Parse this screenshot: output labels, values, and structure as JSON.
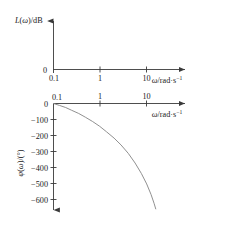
{
  "figure": {
    "title": "",
    "background": "#ffffff",
    "axis_color": "#3a3a3a",
    "curve_color": "#7a7a7a"
  },
  "chart_data": [
    {
      "type": "line",
      "name": "magnitude-plot",
      "title": "",
      "xlabel": "ω/rad·s⁻¹",
      "ylabel": "L(ω)/dB",
      "xscale": "log",
      "x_ticks": [
        0.1,
        1,
        10
      ],
      "x_tick_labels": [
        "0.1",
        "1",
        "10"
      ],
      "xlim": [
        0.1,
        60
      ],
      "y_ticks": [
        0
      ],
      "y_tick_labels": [
        "0"
      ],
      "ylim": [
        0,
        1
      ],
      "grid": false,
      "legend": "none",
      "series": [
        {
          "name": "L(ω)",
          "x": [],
          "values": []
        }
      ],
      "annotations": []
    },
    {
      "type": "line",
      "name": "phase-plot",
      "title": "",
      "xlabel": "ω/rad·s⁻¹",
      "ylabel": "φ(ω)/(°)",
      "xscale": "log",
      "x_ticks": [
        0.1,
        1,
        10
      ],
      "x_tick_labels": [
        "0.1",
        "1",
        "10"
      ],
      "xlim": [
        0.1,
        60
      ],
      "y_ticks": [
        0,
        -100,
        -200,
        -300,
        -400,
        -500,
        -600
      ],
      "y_tick_labels": [
        "0",
        "−100",
        "−200",
        "−300",
        "−400",
        "−500",
        "−600"
      ],
      "ylim": [
        -680,
        0
      ],
      "grid": false,
      "legend": "none",
      "series": [
        {
          "name": "φ(ω)",
          "x": [
            0.1,
            0.13,
            0.17,
            0.22,
            0.3,
            0.4,
            0.55,
            0.75,
            1.0,
            1.4,
            1.9,
            2.6,
            3.5,
            4.6,
            5.8,
            7.0,
            8.0,
            8.6
          ],
          "values": [
            0,
            -12,
            -25,
            -42,
            -62,
            -85,
            -112,
            -142,
            -175,
            -215,
            -258,
            -310,
            -370,
            -435,
            -500,
            -565,
            -620,
            -655
          ]
        }
      ],
      "annotations": []
    }
  ],
  "labels": {
    "mag_y_axis": "L(ω)/dB",
    "phase_y_axis": "φ(ω)/(°)",
    "omega_unit_base": "ω/rad·s",
    "omega_unit_exp": "−1",
    "zero": "0",
    "t01": "0.1",
    "t1": "1",
    "t10": "10",
    "n100": "−100",
    "n200": "−200",
    "n300": "−300",
    "n400": "−400",
    "n500": "−500",
    "n600": "−600"
  }
}
